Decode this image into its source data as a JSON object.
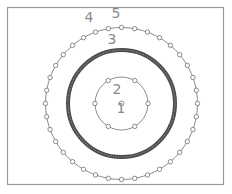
{
  "diagram": {
    "labels": [
      {
        "id": "1",
        "text": "1",
        "refers_to": "center point"
      },
      {
        "id": "2",
        "text": "2",
        "refers_to": "inner bolt circle"
      },
      {
        "id": "3",
        "text": "3",
        "refers_to": "thick middle ring"
      },
      {
        "id": "4",
        "text": "4",
        "refers_to": "outer bolt circle"
      },
      {
        "id": "5",
        "text": "5",
        "refers_to": "outer hole pattern"
      }
    ],
    "inner_circle_hole_count": 6,
    "outer_circle_hole_count": 36,
    "colors": {
      "line": "#6e6e6e",
      "ring": "#4a4a4a",
      "label": "#8a8a8a",
      "frame": "#9a9a9a"
    }
  }
}
